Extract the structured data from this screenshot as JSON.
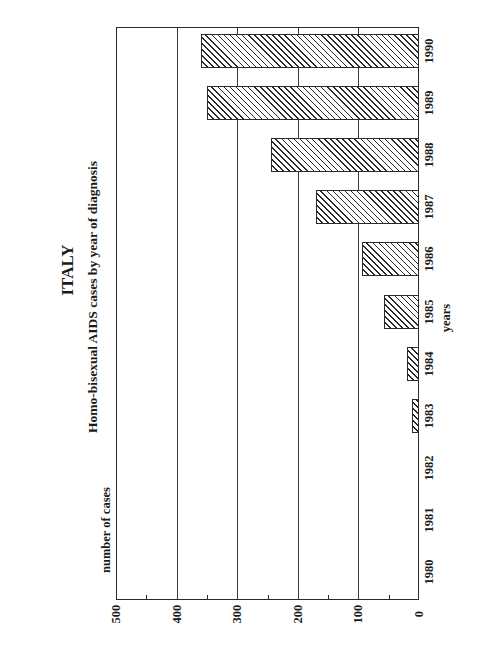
{
  "chart_data": {
    "type": "bar",
    "orientation": "rotated page (horizontal bars in scan; vertical bar chart read with page turned 90°)",
    "title": "ITALY",
    "subtitle": "Homo-bisexual AIDS cases by year of diagnosis",
    "xlabel": "years",
    "ylabel": "number of cases",
    "categories": [
      "1980",
      "1981",
      "1982",
      "1983",
      "1984",
      "1985",
      "1986",
      "1987",
      "1988",
      "1989",
      "1990"
    ],
    "values": [
      0,
      0,
      0,
      11,
      20,
      57,
      94,
      170,
      245,
      350,
      360
    ],
    "ylim": [
      0,
      500
    ],
    "yticks": [
      0,
      100,
      200,
      300,
      400,
      500
    ],
    "minor_ticks": [
      50,
      150,
      250,
      350,
      450
    ],
    "grid": true,
    "bar_pattern": "diagonal hatch",
    "legend": null
  },
  "labels": {
    "title": "ITALY",
    "subtitle": "Homo-bisexual AIDS cases by year of diagnosis",
    "x_axis": "years",
    "y_axis": "number of cases"
  }
}
